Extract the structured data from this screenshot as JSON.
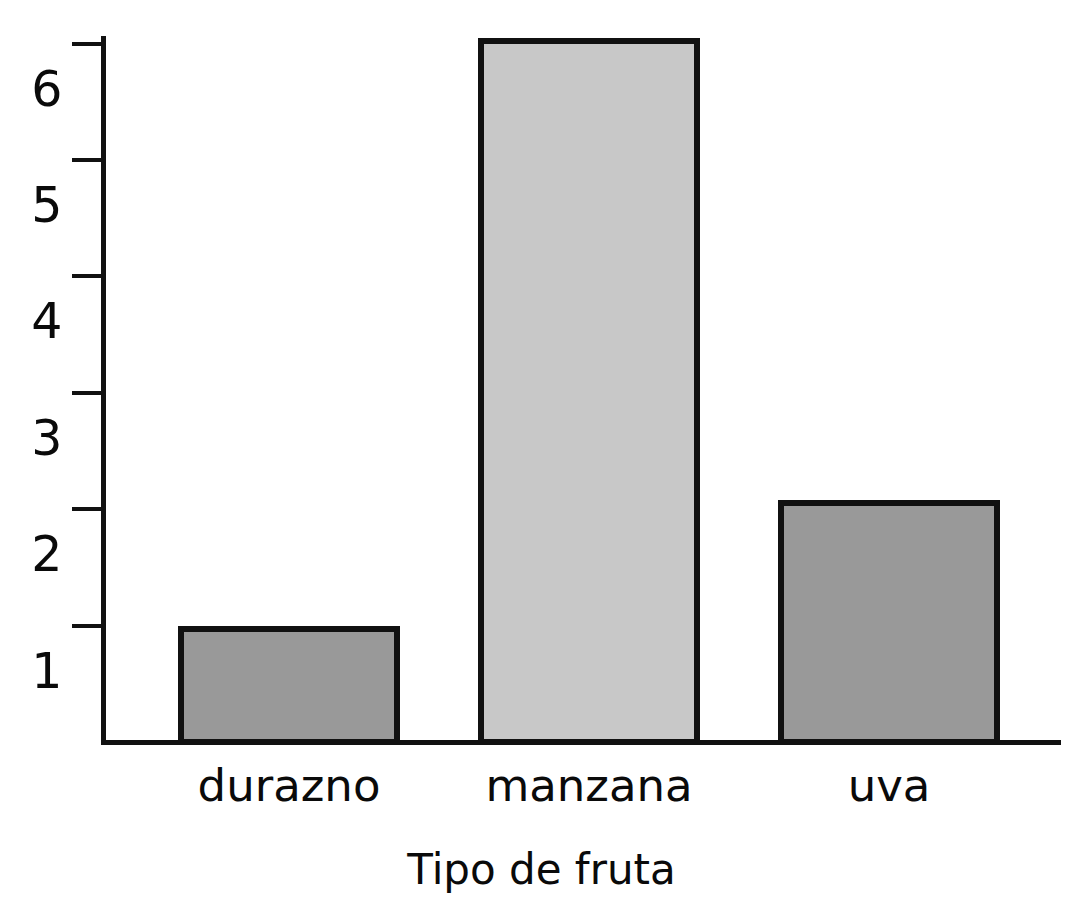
{
  "chart_data": {
    "type": "bar",
    "title": "",
    "xlabel": "Tipo de fruta",
    "ylabel": "",
    "categories": [
      "durazno",
      "manzana",
      "uva"
    ],
    "values": [
      1,
      6.05,
      2.08
    ],
    "ytick_labels": [
      "1",
      "2",
      "3",
      "4",
      "5",
      "6"
    ],
    "ytick_values": [
      1,
      2,
      3,
      4,
      5,
      6
    ],
    "ylim": [
      0,
      6.05
    ],
    "grid": false,
    "legend": false,
    "background_color": "#ffffff",
    "axis_color": "#111111",
    "bar_border_color": "#111111",
    "bar_colors": [
      "#999999",
      "#c8c8c8",
      "#999999"
    ]
  },
  "axis": {
    "x_title": "Tipo de fruta"
  }
}
